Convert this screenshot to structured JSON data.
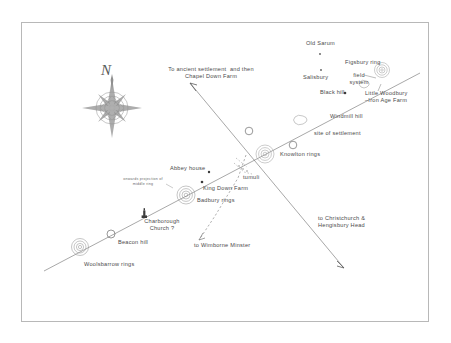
{
  "figure": {
    "background_color": "#ffffff",
    "frame_color": "#b8b8b8",
    "ink_color": "#4a4a4a"
  },
  "compass": {
    "north_letter": "N",
    "icon": "compass-rose-icon"
  },
  "alignments": [
    {
      "name": "main-ley-line",
      "description": "Woolsbarrow rings - Beacon hill - Charborough Church - Badbury rings - King Down Farm - Knowlton rings - Windmill hill - Black hill - Figsbury ring"
    },
    {
      "name": "cross-ley-line",
      "description": "Chapel Down Farm to Christchurch and Hengistbury Head"
    },
    {
      "name": "wimborne-branch",
      "description": "dashed branch to Wimborne Minster"
    }
  ],
  "labels": {
    "old_sarum": "Old Sarum",
    "figsbury_ring": "Figsbury ring",
    "salisbury": "Salisbury",
    "field_system": "field\nsystem",
    "little_woodbury": "Little Woodbury\n–Iron Age Farm",
    "black_hill": "Black hill",
    "windmill_hill": "Windmill hill",
    "site_of_settlement": "site of settlement",
    "knowlton_rings": "Knowlton rings",
    "abbey_house": "Abbey house",
    "tumuli": "tumuli",
    "king_down_farm": "King Down Farm",
    "badbury_rings": "Badbury rings",
    "onwards_projection": "onwards projection of\nmiddle ring",
    "charborough_church": "Charborough\nChurch ?",
    "beacon_hill": "Beacon hill",
    "woolsbarrow_rings": "Woolsbarrow rings",
    "to_chapel_down": "To ancient settlement  and then\nChapel Down Farm",
    "to_wimborne": "to Wimborne Minster",
    "to_christchurch": "to Christchurch &\nHengisbury Head"
  }
}
